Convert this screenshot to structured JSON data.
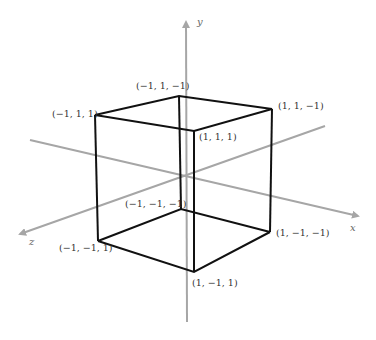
{
  "figure": {
    "axes": {
      "x": {
        "label": "x"
      },
      "y": {
        "label": "y"
      },
      "z": {
        "label": "z"
      }
    },
    "vertices": [
      {
        "id": "v0",
        "label": "(−1, 1, −1)"
      },
      {
        "id": "v1",
        "label": "(−1, 1, 1)"
      },
      {
        "id": "v2",
        "label": "(1, 1, −1)"
      },
      {
        "id": "v3",
        "label": "(1, 1, 1)"
      },
      {
        "id": "v4",
        "label": "(−1, −1, −1)"
      },
      {
        "id": "v5",
        "label": "(−1, −1, 1)"
      },
      {
        "id": "v6",
        "label": "(1, −1, −1)"
      },
      {
        "id": "v7",
        "label": "(1, −1, 1)"
      }
    ],
    "colors": {
      "axis": "#a6a6a6",
      "edge": "#111111",
      "label": "#333333"
    }
  }
}
